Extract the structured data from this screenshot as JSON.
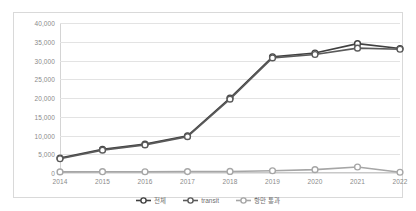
{
  "chart_data": {
    "type": "line",
    "title": "",
    "xlabel": "",
    "ylabel": "",
    "categories": [
      "2014",
      "2015",
      "2016",
      "2017",
      "2018",
      "2019",
      "2020",
      "2021",
      "2022"
    ],
    "ylim": [
      0,
      40000
    ],
    "ytick_labels": [
      "40,000",
      "35,000",
      "30,000",
      "25,000",
      "20,000",
      "15,000",
      "10,000",
      "5,000",
      "0"
    ],
    "ytick_values": [
      40000,
      35000,
      30000,
      25000,
      20000,
      15000,
      10000,
      5000,
      0
    ],
    "grid": true,
    "legend_position": "bottom",
    "series": [
      {
        "name": "전체",
        "color": "#404040",
        "marker": "circle-open",
        "values": [
          4000,
          6300,
          7700,
          9900,
          20000,
          31000,
          32000,
          34500,
          33200
        ]
      },
      {
        "name": "transit",
        "color": "#5a5a5a",
        "marker": "circle-open",
        "values": [
          3800,
          6100,
          7500,
          9700,
          19700,
          30700,
          31600,
          33300,
          33000
        ]
      },
      {
        "name": "항만 통과",
        "color": "#a6a6a6",
        "marker": "circle-open",
        "values": [
          300,
          350,
          330,
          380,
          420,
          600,
          900,
          1600,
          200
        ]
      }
    ]
  },
  "colors": {
    "series_total": "#404040",
    "series_transit": "#5a5a5a",
    "series_port": "#a6a6a6",
    "grid": "#e3e3e3",
    "axis_text": "#8a8a8a",
    "border": "#d9d9d9"
  }
}
